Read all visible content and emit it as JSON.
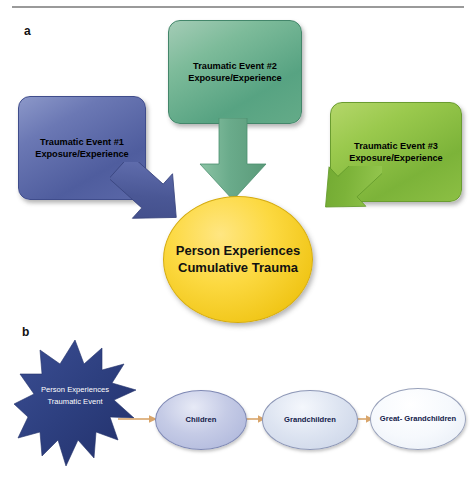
{
  "figure": {
    "panels": [
      {
        "letter": "a",
        "nodes": {
          "event1": {
            "line1": "Traumatic Event #1",
            "line2": "Exposure/Experience",
            "color": "#5a67a8"
          },
          "event2": {
            "line1": "Traumatic Event #2",
            "line2": "Exposure/Experience",
            "color": "#64ab88"
          },
          "event3": {
            "line1": "Traumatic Event #3",
            "line2": "Exposure/Experience",
            "color": "#8cbf44"
          },
          "center": {
            "line1": "Person",
            "line2": "Experiences",
            "line3": "Cumulative",
            "line4": "Trauma",
            "color": "#fbd73c"
          }
        },
        "arrows": [
          {
            "name": "arrow-event1-to-center",
            "direction": "down-right",
            "color": "#4a5795"
          },
          {
            "name": "arrow-event2-to-center",
            "direction": "down",
            "color": "#6aab8b"
          },
          {
            "name": "arrow-event3-to-center",
            "direction": "down-left",
            "color": "#7cb339"
          }
        ]
      },
      {
        "letter": "b",
        "nodes": {
          "burst": {
            "line1": "Person",
            "line2": "Experiences",
            "line3": "Traumatic",
            "line4": "Event",
            "color": "#2d3f7f"
          },
          "children": {
            "line1": "Children",
            "color": "#aab3d9"
          },
          "grandchildren": {
            "line1": "Grandchildren",
            "color": "#c8d2e6"
          },
          "greatgrandchildren": {
            "line1": "Great-",
            "line2": "Grandchildren",
            "color": "#e6ecf5"
          }
        },
        "connectors": [
          {
            "name": "connector-burst-to-children",
            "color": "#d9a56a"
          },
          {
            "name": "connector-children-to-grandchildren",
            "color": "#d9a56a"
          },
          {
            "name": "connector-grandchildren-to-greatgrandchildren",
            "color": "#d9a56a"
          }
        ]
      }
    ]
  }
}
